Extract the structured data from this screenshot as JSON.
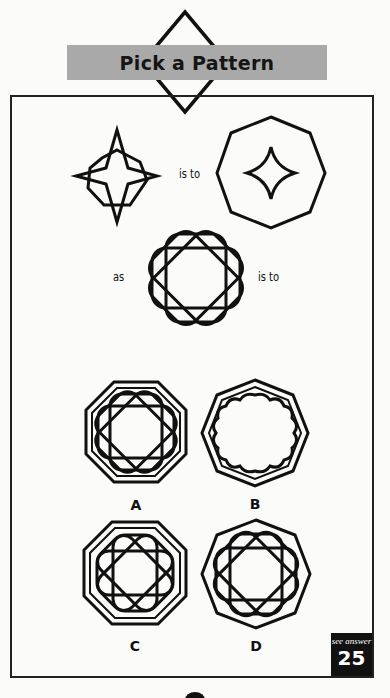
{
  "header": {
    "title": "Pick a Pattern"
  },
  "puzzle": {
    "analogy_labels": {
      "first_is_to": "is to",
      "as": "as",
      "second_is_to": "is to"
    },
    "figures": {
      "top_left": "four-point-star-over-square-icon",
      "top_right": "octagon-with-concave-diamond-icon",
      "middle": "eight-lobed-rosette-icon"
    }
  },
  "options": [
    {
      "letter": "A",
      "description": "flat-top double octagon with rosette"
    },
    {
      "letter": "B",
      "description": "pointed double octagon with scalloped outline"
    },
    {
      "letter": "C",
      "description": "flat-top double octagon with star-center rosette"
    },
    {
      "letter": "D",
      "description": "pointed single octagon with rosette"
    }
  ],
  "answer_badge": {
    "caption": "see answer",
    "number": "25"
  },
  "colors": {
    "ink": "#111111",
    "banner": "#a9a9a9",
    "paper": "#fbfbfa"
  }
}
